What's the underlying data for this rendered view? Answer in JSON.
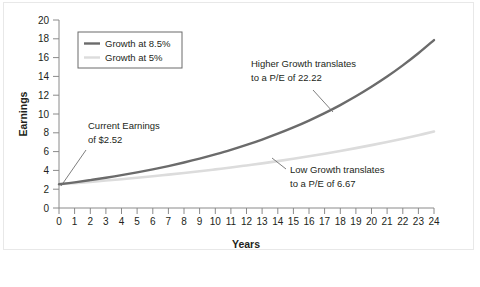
{
  "chart_data": {
    "type": "line",
    "title": "",
    "xlabel": "Years",
    "ylabel": "Earnings",
    "xlim": [
      0,
      24
    ],
    "ylim": [
      0,
      20
    ],
    "grid": false,
    "legend_position": "top-left",
    "x": [
      0,
      1,
      2,
      3,
      4,
      5,
      6,
      7,
      8,
      9,
      10,
      11,
      12,
      13,
      14,
      15,
      16,
      17,
      18,
      19,
      20,
      21,
      22,
      23,
      24
    ],
    "xticks": [
      "0",
      "1",
      "2",
      "3",
      "4",
      "5",
      "6",
      "7",
      "8",
      "9",
      "10",
      "11",
      "12",
      "13",
      "14",
      "15",
      "16",
      "17",
      "18",
      "19",
      "20",
      "21",
      "22",
      "23",
      "24"
    ],
    "yticks": [
      "0",
      "2",
      "4",
      "6",
      "8",
      "10",
      "12",
      "14",
      "16",
      "18",
      "20"
    ],
    "series": [
      {
        "name": "Growth at 8.5%",
        "color": "#6b6b6b",
        "values": [
          2.52,
          2.73,
          2.97,
          3.22,
          3.49,
          3.79,
          4.11,
          4.46,
          4.84,
          5.25,
          5.7,
          6.18,
          6.71,
          7.28,
          7.9,
          8.57,
          9.3,
          10.09,
          10.95,
          11.88,
          12.89,
          13.98,
          15.17,
          16.46,
          17.86
        ]
      },
      {
        "name": "Growth at 5%",
        "color": "#dcdcdc",
        "values": [
          2.52,
          2.65,
          2.78,
          2.92,
          3.06,
          3.22,
          3.38,
          3.55,
          3.72,
          3.91,
          4.11,
          4.31,
          4.53,
          4.75,
          4.99,
          5.24,
          5.5,
          5.78,
          6.07,
          6.37,
          6.69,
          7.02,
          7.37,
          7.74,
          8.13
        ]
      }
    ],
    "annotations": [
      {
        "id": "current-earnings",
        "line1": "Current Earnings",
        "line2": "of $2.52"
      },
      {
        "id": "higher-growth",
        "line1": "Higher Growth translates",
        "line2": "to a P/E of 22.22"
      },
      {
        "id": "low-growth",
        "line1": "Low Growth translates",
        "line2": "to a P/E of 6.67"
      }
    ]
  },
  "legend": {
    "items": [
      {
        "label": "Growth at 8.5%"
      },
      {
        "label": "Growth at 5%"
      }
    ]
  },
  "axes": {
    "x_title": "Years",
    "y_title": "Earnings"
  }
}
